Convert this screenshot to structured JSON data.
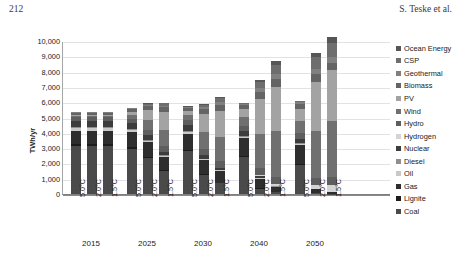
{
  "header": {
    "page_number": "212",
    "running_head": "S. Teske et al."
  },
  "chart_data": {
    "type": "bar",
    "stacked": true,
    "title": "",
    "xlabel": "",
    "ylabel": "TWh/yr",
    "ylim": [
      0,
      10000
    ],
    "ytick_labels": [
      "10,000",
      "9,000",
      "8,000",
      "7,000",
      "6,000",
      "5,000",
      "4,000",
      "3,000",
      "2,000",
      "1,000",
      "0"
    ],
    "ytick_values": [
      10000,
      9000,
      8000,
      7000,
      6000,
      5000,
      4000,
      3000,
      2000,
      1000,
      0
    ],
    "grid": true,
    "legend_position": "right",
    "group_labels": [
      "2015",
      "2025",
      "2030",
      "2040",
      "2050"
    ],
    "scenario_labels": [
      "5.0°C",
      "2.0°C",
      "1.5°C"
    ],
    "categories": [
      "2015 5.0°C",
      "2015 2.0°C",
      "2015 1.5°C",
      "2025 5.0°C",
      "2025 2.0°C",
      "2025 1.5°C",
      "2030 5.0°C",
      "2030 2.0°C",
      "2030 1.5°C",
      "2040 5.0°C",
      "2040 2.0°C",
      "2040 1.5°C",
      "2050 5.0°C",
      "2050 2.0°C",
      "2050 1.5°C"
    ],
    "series": [
      {
        "name": "Coal",
        "color": "#4a4a4a",
        "values": [
          3150,
          3150,
          3150,
          2950,
          2350,
          1500,
          2800,
          1250,
          700,
          2400,
          350,
          130,
          1900,
          70,
          30
        ]
      },
      {
        "name": "Lignite",
        "color": "#1c1c1c",
        "values": [
          120,
          120,
          120,
          110,
          90,
          60,
          100,
          50,
          30,
          90,
          15,
          5,
          70,
          0,
          0
        ]
      },
      {
        "name": "Gas",
        "color": "#2e2e2e",
        "values": [
          880,
          880,
          880,
          1000,
          950,
          850,
          1050,
          900,
          760,
          1150,
          650,
          330,
          1250,
          250,
          120
        ]
      },
      {
        "name": "Oil",
        "color": "#c9c9c9",
        "values": [
          140,
          140,
          140,
          120,
          100,
          80,
          110,
          80,
          60,
          90,
          40,
          20,
          70,
          15,
          5
        ]
      },
      {
        "name": "Diesel",
        "color": "#8f8f8f",
        "values": [
          60,
          60,
          60,
          55,
          45,
          35,
          50,
          35,
          25,
          45,
          20,
          10,
          40,
          10,
          5
        ]
      },
      {
        "name": "Nuclear",
        "color": "#3c3c3c",
        "values": [
          420,
          420,
          420,
          400,
          330,
          230,
          390,
          260,
          140,
          340,
          120,
          0,
          300,
          0,
          0
        ]
      },
      {
        "name": "Hydrogen",
        "color": "#d4d4d4",
        "values": [
          0,
          0,
          0,
          0,
          0,
          5,
          0,
          5,
          20,
          0,
          60,
          160,
          0,
          220,
          420
        ]
      },
      {
        "name": "Hydro",
        "color": "#5e5e5e",
        "values": [
          270,
          270,
          270,
          300,
          330,
          360,
          320,
          360,
          400,
          360,
          430,
          470,
          390,
          480,
          510
        ]
      },
      {
        "name": "Wind",
        "color": "#707070",
        "values": [
          90,
          90,
          90,
          250,
          650,
          1050,
          330,
          1100,
          1600,
          540,
          2250,
          3000,
          760,
          3100,
          3700
        ]
      },
      {
        "name": "PV",
        "color": "#a3a3a3",
        "values": [
          50,
          50,
          50,
          200,
          650,
          1180,
          290,
          1200,
          1700,
          540,
          2300,
          2900,
          790,
          3200,
          3300
        ]
      },
      {
        "name": "Biomass",
        "color": "#646464",
        "values": [
          130,
          130,
          130,
          170,
          250,
          310,
          200,
          300,
          380,
          260,
          420,
          480,
          310,
          480,
          500
        ]
      },
      {
        "name": "Geothermal",
        "color": "#808080",
        "values": [
          30,
          30,
          30,
          45,
          90,
          130,
          60,
          140,
          190,
          90,
          260,
          330,
          120,
          320,
          380
        ]
      },
      {
        "name": "CSP",
        "color": "#6e6e6e",
        "values": [
          0,
          0,
          0,
          10,
          80,
          140,
          20,
          150,
          250,
          40,
          400,
          620,
          60,
          800,
          900
        ]
      },
      {
        "name": "Ocean Energy",
        "color": "#565656",
        "values": [
          0,
          0,
          0,
          5,
          25,
          55,
          10,
          60,
          120,
          20,
          150,
          270,
          30,
          300,
          380
        ]
      }
    ],
    "legend_entries": [
      "Ocean Energy",
      "CSP",
      "Geothermal",
      "Biomass",
      "PV",
      "Wind",
      "Hydro",
      "Hydrogen",
      "Nuclear",
      "Diesel",
      "Oil",
      "Gas",
      "Lignite",
      "Coal"
    ],
    "bar_totals": [
      5340,
      5340,
      5340,
      5615,
      5945,
      5985,
      5730,
      5890,
      6375,
      5965,
      7465,
      8725,
      6090,
      9245,
      10250
    ]
  }
}
